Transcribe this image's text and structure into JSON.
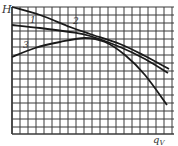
{
  "chart_data": {
    "type": "line",
    "title": "",
    "xlabel": "q_V",
    "ylabel": "H",
    "grid": true,
    "axis_ticks": "none (unlabeled grid)",
    "series": [
      {
        "name": "1",
        "label": "1",
        "points_px": [
          [
            12,
            25
          ],
          [
            40,
            28
          ],
          [
            70,
            32
          ],
          [
            90,
            36
          ],
          [
            120,
            47
          ],
          [
            145,
            59
          ],
          [
            168,
            73
          ]
        ]
      },
      {
        "name": "2",
        "label": "2",
        "points_px": [
          [
            12,
            7
          ],
          [
            40,
            15
          ],
          [
            70,
            27
          ],
          [
            90,
            34
          ],
          [
            120,
            44
          ],
          [
            145,
            56
          ],
          [
            169,
            69
          ]
        ]
      },
      {
        "name": "3",
        "label": "3",
        "points_px": [
          [
            12,
            57
          ],
          [
            35,
            48
          ],
          [
            60,
            42
          ],
          [
            85,
            38
          ],
          [
            105,
            42
          ],
          [
            125,
            55
          ],
          [
            145,
            75
          ],
          [
            167,
            105
          ]
        ]
      }
    ]
  },
  "labels": {
    "y_axis": "H",
    "x_axis": "q",
    "x_axis_sub": "V",
    "curve1": "1",
    "curve2": "2",
    "curve3": "3"
  },
  "colors": {
    "grid": "#3a3a3a",
    "curve": "#1a1a1a",
    "background": "#ffffff"
  }
}
